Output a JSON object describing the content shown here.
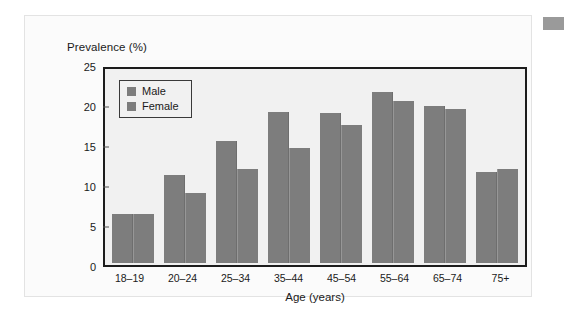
{
  "figure": {
    "corner_marker": "gray-block"
  },
  "chart_data": {
    "type": "bar",
    "title": "",
    "ylabel": "Prevalence (%)",
    "xlabel": "Age (years)",
    "categories": [
      "18–19",
      "20–24",
      "25–34",
      "35–44",
      "45–54",
      "55–64",
      "65–74",
      "75+"
    ],
    "series": [
      {
        "name": "Male",
        "values": [
          6.4,
          11.4,
          15.9,
          19.6,
          19.5,
          22.3,
          20.5,
          11.8
        ]
      },
      {
        "name": "Female",
        "values": [
          6.4,
          9.1,
          12.3,
          15.0,
          18.0,
          21.1,
          20.1,
          12.3
        ]
      }
    ],
    "ylim": [
      0,
      25
    ],
    "yticks": [
      0,
      5,
      10,
      15,
      20,
      25
    ],
    "ytick_labels": [
      "0",
      "5",
      "10",
      "15",
      "20",
      "25"
    ],
    "grid": false,
    "legend_position": "top-left",
    "colors": {
      "male_bar": "#7d7d7d",
      "female_bar": "#7d7d7d",
      "plot_background": "#f1f1f1",
      "axis": "#1c1c1c",
      "panel_background": "#fbfbfb"
    }
  }
}
